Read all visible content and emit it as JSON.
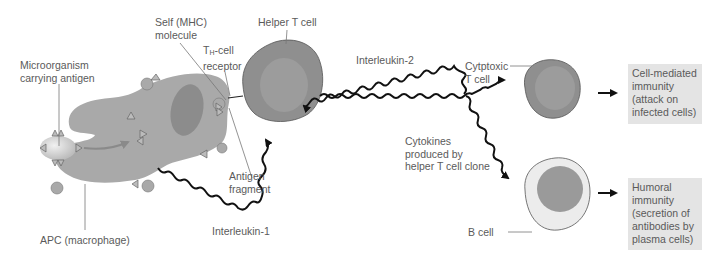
{
  "labels": {
    "microorganism": [
      "Microorganism",
      "carrying antigen"
    ],
    "self_mhc": [
      "Self (MHC)",
      "molecule"
    ],
    "th_receptor_prefix": "T",
    "th_receptor_sub": "H",
    "th_receptor_suffix": "-cell",
    "th_receptor_line2": "receptor",
    "helper_t": "Helper T cell",
    "interleukin2": "Interleukin-2",
    "cytotoxic": [
      "Cytptoxic",
      "T cell"
    ],
    "antigen_fragment": [
      "Antigen",
      "fragment"
    ],
    "apc": "APC (macrophage)",
    "interleukin1": "Interleukin-1",
    "cytokines": [
      "Cytokines",
      "produced by",
      "helper T cell clone"
    ],
    "b_cell": "B cell"
  },
  "outcomes": {
    "cell_mediated": [
      "Cell-mediated",
      "immunity",
      "(attack on",
      "infected cells)"
    ],
    "humoral": [
      "Humoral",
      "immunity",
      "(secretion of",
      "antibodies by",
      "plasma cells)"
    ]
  },
  "colors": {
    "apc": "#a9a9a9",
    "apc_nucleus": "#8c8c8c",
    "t_cell": "#8f8f8f",
    "t_cell_inner": "#9c9c9c",
    "b_cell_outer": "#ececec",
    "b_cell_nucleus": "#9a9a9a",
    "outcome_box": "#e4e4e4",
    "signal": "#111111"
  }
}
